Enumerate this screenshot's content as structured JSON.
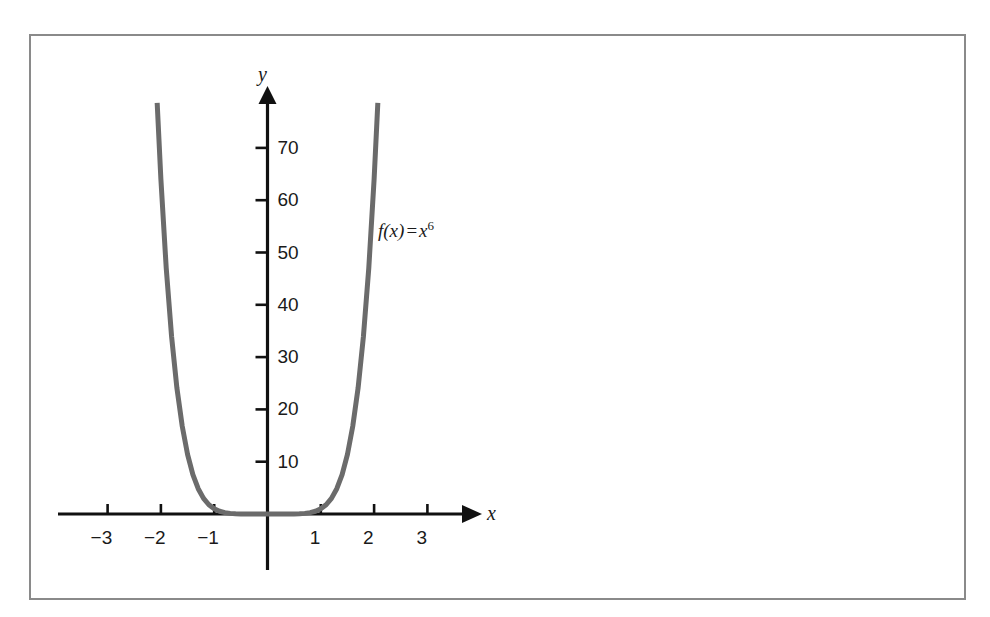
{
  "figure": {
    "background_color": "#ffffff",
    "frame_color": "#8a8a8a",
    "axis_color": "#111111",
    "curve_color": "#6b6b6b"
  },
  "axes": {
    "x_axis_name": "x",
    "y_axis_name": "y",
    "x_ticks": [
      {
        "value": -3,
        "label": "−3"
      },
      {
        "value": -2,
        "label": "−2"
      },
      {
        "value": -1,
        "label": "−1"
      },
      {
        "value": 1,
        "label": "1"
      },
      {
        "value": 2,
        "label": "2"
      },
      {
        "value": 3,
        "label": "3"
      }
    ],
    "y_ticks": [
      {
        "value": 10,
        "label": "10"
      },
      {
        "value": 20,
        "label": "20"
      },
      {
        "value": 30,
        "label": "30"
      },
      {
        "value": 40,
        "label": "40"
      },
      {
        "value": 50,
        "label": "50"
      },
      {
        "value": 60,
        "label": "60"
      },
      {
        "value": 70,
        "label": "70"
      }
    ]
  },
  "curve_label": {
    "function_name": "f",
    "argument": "(x)",
    "equals": "=",
    "variable": "x",
    "exponent": "6"
  },
  "chart_data": {
    "type": "line",
    "title": "",
    "xlabel": "x",
    "ylabel": "y",
    "legend": [
      "f(x) = x^6"
    ],
    "grid": false,
    "legend_position": "inline-right-of-curve",
    "xlim": [
      -3.9,
      3.8
    ],
    "ylim": [
      -1.1,
      75
    ],
    "xticks": [
      -3,
      -2,
      -1,
      1,
      2,
      3
    ],
    "yticks": [
      10,
      20,
      30,
      40,
      50,
      60,
      70
    ],
    "series": [
      {
        "name": "f(x) = x^6",
        "expression": "x^6",
        "color": "#6b6b6b",
        "line_width": 5,
        "x_domain": [
          -2.07,
          2.07
        ],
        "x": [
          -2.07,
          -2.0,
          -1.9,
          -1.8,
          -1.7,
          -1.6,
          -1.5,
          -1.4,
          -1.3,
          -1.2,
          -1.1,
          -1.0,
          -0.9,
          -0.8,
          -0.7,
          -0.6,
          -0.5,
          -0.4,
          -0.3,
          -0.2,
          -0.1,
          0.0,
          0.1,
          0.2,
          0.3,
          0.4,
          0.5,
          0.6,
          0.7,
          0.8,
          0.9,
          1.0,
          1.1,
          1.2,
          1.3,
          1.4,
          1.5,
          1.6,
          1.7,
          1.8,
          1.9,
          2.0,
          2.07
        ],
        "values": [
          78.6,
          64.0,
          47.0,
          34.0,
          24.1,
          16.8,
          11.4,
          7.53,
          4.83,
          2.99,
          1.77,
          1.0,
          0.53,
          0.26,
          0.12,
          0.047,
          0.016,
          0.004,
          0.001,
          0.0,
          0.0,
          0.0,
          0.0,
          0.0,
          0.001,
          0.004,
          0.016,
          0.047,
          0.12,
          0.26,
          0.53,
          1.0,
          1.77,
          2.99,
          4.83,
          7.53,
          11.4,
          16.8,
          24.1,
          34.0,
          47.0,
          64.0,
          78.6
        ]
      }
    ]
  }
}
